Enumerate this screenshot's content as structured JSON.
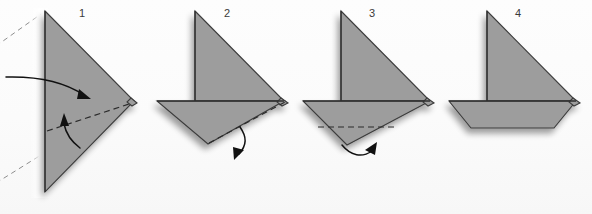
{
  "figure": {
    "background_color": "#fbfbfb",
    "paper_fill_color": "#9d9d9d",
    "paper_edge_color": "#2f2f2f",
    "fold_line_color": "#2b2b2b",
    "arrow_color": "#111111",
    "step_count": 4
  },
  "steps": [
    {
      "number": "1",
      "label_x": 82,
      "label_y": 14,
      "description": "Triangle pointing right with vertical center crease; fold top flap over and fold lower corner up",
      "arrows": [
        {
          "name": "fold-over-arrow",
          "direction": "right-down"
        },
        {
          "name": "fold-up-arrow",
          "direction": "up"
        }
      ],
      "fold_lines": 1,
      "ghost_lines": 2
    },
    {
      "number": "2",
      "label_x": 227,
      "label_y": 14,
      "description": "Sailboat shape with pointed hull; fold hull bottom edge under",
      "arrows": [
        {
          "name": "fold-under-arrow",
          "direction": "down-right"
        }
      ],
      "fold_lines": 1,
      "ghost_lines": 0
    },
    {
      "number": "3",
      "label_x": 372,
      "label_y": 14,
      "description": "Sailboat with horizontal dashed fold across hull; fold remaining point up behind",
      "arrows": [
        {
          "name": "fold-behind-arrow",
          "direction": "up-right"
        }
      ],
      "fold_lines": 1,
      "ghost_lines": 0
    },
    {
      "number": "4",
      "label_x": 518,
      "label_y": 14,
      "description": "Completed sailboat with trapezoid hull and triangular sail",
      "arrows": [],
      "fold_lines": 0,
      "ghost_lines": 0
    }
  ]
}
